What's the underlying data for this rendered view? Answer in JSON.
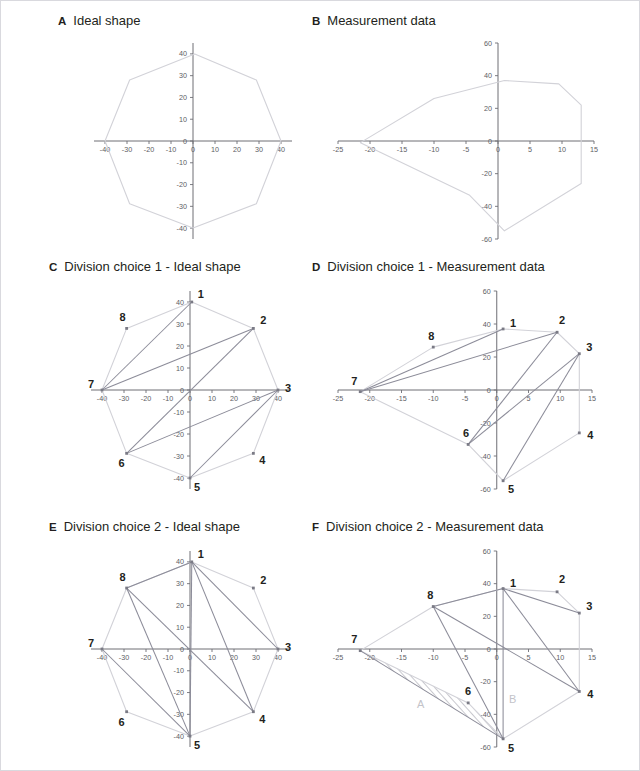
{
  "figure": {
    "panels": [
      {
        "id": "A",
        "letter": "A",
        "title": "Ideal shape"
      },
      {
        "id": "B",
        "letter": "B",
        "title": "Measurement data"
      },
      {
        "id": "C",
        "letter": "C",
        "title": "Division choice 1 - Ideal shape"
      },
      {
        "id": "D",
        "letter": "D",
        "title": "Division choice 1 - Measurement data"
      },
      {
        "id": "E",
        "letter": "E",
        "title": "Division choice 2 - Ideal shape"
      },
      {
        "id": "F",
        "letter": "F",
        "title": "Division choice 2 - Measurement data"
      }
    ]
  },
  "colors": {
    "outline": "#d2d2d8",
    "diagonal": "#8c8c99",
    "axis": "#6e6e75",
    "tick_text": "#5d5d63",
    "vertex_marker": "#7a7a85",
    "vertex_number": "#231f20",
    "region_label": "#c3c3c9",
    "hatch": "#9a9aa5",
    "frame": "#d9d9de",
    "background": "#ffffff"
  },
  "axes": {
    "ideal": {
      "xlim": [
        -45,
        45
      ],
      "ylim": [
        -45,
        45
      ],
      "xticks": [
        -40,
        -30,
        -20,
        -10,
        0,
        10,
        20,
        30,
        40
      ],
      "yticks": [
        40,
        30,
        20,
        10,
        0,
        -10,
        -20,
        -30,
        -40
      ],
      "xtick_labels": [
        "-40",
        "-30",
        "-20",
        "-10",
        "0",
        "10",
        "20",
        "30",
        "40"
      ],
      "ytick_labels": [
        "40",
        "30",
        "20",
        "10",
        "0",
        "-10",
        "-20",
        "-30",
        "-40"
      ]
    },
    "measured": {
      "xlim": [
        -25,
        15
      ],
      "ylim": [
        -60,
        60
      ],
      "xticks": [
        -25,
        -20,
        -15,
        -10,
        -5,
        0,
        5,
        10,
        15
      ],
      "yticks": [
        60,
        40,
        20,
        0,
        -20,
        -40,
        -60
      ],
      "xtick_labels": [
        "-25",
        "-20",
        "-15",
        "-10",
        "-5",
        "0",
        "5",
        "10",
        "15"
      ],
      "ytick_labels": [
        "60",
        "40",
        "20",
        "0",
        "-20",
        "-40",
        "-60"
      ]
    }
  },
  "chart_data": {
    "type": "scatter",
    "vertex_labels": [
      "1",
      "2",
      "3",
      "4",
      "5",
      "6",
      "7",
      "8"
    ],
    "shapes": {
      "ideal": {
        "name": "Ideal shape",
        "xlabel": "",
        "ylabel": "",
        "closed": true,
        "points": [
          {
            "id": 1,
            "x": 0.8,
            "y": 40.0
          },
          {
            "id": 2,
            "x": 28.8,
            "y": 28.0
          },
          {
            "id": 3,
            "x": 40.0,
            "y": 0.0
          },
          {
            "id": 4,
            "x": 28.8,
            "y": -28.8
          },
          {
            "id": 5,
            "x": 0.0,
            "y": -40.0
          },
          {
            "id": 6,
            "x": -28.8,
            "y": -28.8
          },
          {
            "id": 7,
            "x": -40.0,
            "y": 0.0
          },
          {
            "id": 8,
            "x": -28.8,
            "y": 28.0
          }
        ]
      },
      "measured": {
        "name": "Measurement data",
        "xlabel": "",
        "ylabel": "",
        "closed": true,
        "points": [
          {
            "id": 1,
            "x": 1.0,
            "y": 37.0
          },
          {
            "id": 2,
            "x": 9.5,
            "y": 35.0
          },
          {
            "id": 3,
            "x": 13.0,
            "y": 22.0
          },
          {
            "id": 4,
            "x": 13.0,
            "y": -26.0
          },
          {
            "id": 5,
            "x": 1.0,
            "y": -55.0
          },
          {
            "id": 6,
            "x": -4.5,
            "y": -33.0
          },
          {
            "id": 7,
            "x": -21.5,
            "y": -1.0
          },
          {
            "id": 8,
            "x": -10.0,
            "y": 26.0
          }
        ]
      }
    },
    "division_choice_1": {
      "name": "Division choice 1",
      "diagonals": [
        [
          1,
          7
        ],
        [
          7,
          2
        ],
        [
          2,
          6
        ],
        [
          6,
          3
        ],
        [
          3,
          5
        ]
      ]
    },
    "division_choice_2": {
      "name": "Division choice 2",
      "diagonals": [
        [
          1,
          8
        ],
        [
          1,
          3
        ],
        [
          1,
          4
        ],
        [
          1,
          5
        ],
        [
          8,
          5
        ],
        [
          8,
          4
        ],
        [
          7,
          5
        ]
      ]
    },
    "regions": [
      {
        "label": "A",
        "panel": "F",
        "fill": "hatched",
        "x": -12.0,
        "y": -36.0
      },
      {
        "label": "B",
        "panel": "F",
        "fill": "none",
        "x": 2.5,
        "y": -33.0
      }
    ]
  }
}
